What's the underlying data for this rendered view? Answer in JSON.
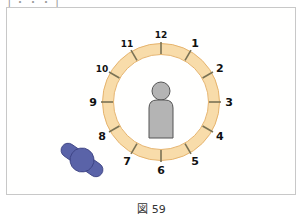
{
  "header_clipped_text": "[ ・ ・ ・ ]",
  "caption": "図 59",
  "clock": {
    "numbers": [
      "12",
      "1",
      "2",
      "3",
      "4",
      "5",
      "6",
      "7",
      "8",
      "9",
      "10",
      "11"
    ],
    "ring_color": "#f8dcaa",
    "ring_edge_color": "#e6b46e",
    "tick_color": "#7a7254"
  },
  "person_figure": {
    "color": "#b4b4b4",
    "outline": "#555555"
  },
  "blue_figure": {
    "color": "#5a63a8",
    "outline": "#3a4080"
  }
}
